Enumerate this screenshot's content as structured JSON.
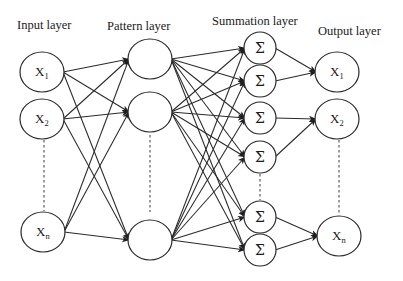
{
  "diagram": {
    "layers": [
      {
        "id": "input",
        "label": "Input layer",
        "label_pos": [
          17,
          29
        ]
      },
      {
        "id": "pattern",
        "label": "Pattern layer",
        "label_pos": [
          107,
          30
        ]
      },
      {
        "id": "summation",
        "label": "Summation layer",
        "label_pos": [
          212,
          25
        ]
      },
      {
        "id": "output",
        "label": "Output layer",
        "label_pos": [
          318,
          35
        ]
      }
    ],
    "nodes": {
      "input": [
        {
          "id": "in1",
          "symbol": "X",
          "sub": "1",
          "cx": 42,
          "cy": 72,
          "rx": 22,
          "ry": 20
        },
        {
          "id": "in2",
          "symbol": "X",
          "sub": "2",
          "cx": 42,
          "cy": 119,
          "rx": 22,
          "ry": 20
        },
        {
          "id": "inn",
          "symbol": "X",
          "sub": "n",
          "cx": 43,
          "cy": 232,
          "rx": 22,
          "ry": 20
        }
      ],
      "pattern": [
        {
          "id": "p1",
          "cx": 150,
          "cy": 59,
          "rx": 22,
          "ry": 20
        },
        {
          "id": "p2",
          "cx": 150,
          "cy": 112,
          "rx": 22,
          "ry": 20
        },
        {
          "id": "pn",
          "cx": 150,
          "cy": 240,
          "rx": 22,
          "ry": 20
        }
      ],
      "summation": [
        {
          "id": "s1",
          "symbol": "Σ",
          "cx": 260,
          "cy": 48,
          "r": 16
        },
        {
          "id": "s2",
          "symbol": "Σ",
          "cx": 260,
          "cy": 81,
          "r": 16
        },
        {
          "id": "s3",
          "symbol": "Σ",
          "cx": 260,
          "cy": 118,
          "r": 16
        },
        {
          "id": "s4",
          "symbol": "Σ",
          "cx": 260,
          "cy": 157,
          "r": 16
        },
        {
          "id": "s5",
          "symbol": "Σ",
          "cx": 260,
          "cy": 217,
          "r": 16
        },
        {
          "id": "s6",
          "symbol": "Σ",
          "cx": 260,
          "cy": 250,
          "r": 16
        }
      ],
      "output": [
        {
          "id": "o1",
          "symbol": "X",
          "sub": "1",
          "cx": 337,
          "cy": 72,
          "rx": 22,
          "ry": 20
        },
        {
          "id": "o2",
          "symbol": "X",
          "sub": "2",
          "cx": 337,
          "cy": 119,
          "rx": 22,
          "ry": 20
        },
        {
          "id": "on",
          "symbol": "X",
          "sub": "n",
          "cx": 339,
          "cy": 236,
          "rx": 22,
          "ry": 20
        }
      ]
    },
    "edges": {
      "input_to_pattern": "fully-connected",
      "pattern_to_summation": "fully-connected",
      "summation_to_output": [
        [
          "s1",
          "o1"
        ],
        [
          "s2",
          "o1"
        ],
        [
          "s3",
          "o2"
        ],
        [
          "s4",
          "o2"
        ],
        [
          "s5",
          "on"
        ],
        [
          "s6",
          "on"
        ]
      ]
    },
    "ellipsis": [
      {
        "layer": "input",
        "x": 44,
        "y1": 140,
        "y2": 211
      },
      {
        "layer": "pattern",
        "x": 150,
        "y1": 135,
        "y2": 212
      },
      {
        "layer": "summation",
        "x": 260,
        "y1": 174,
        "y2": 200
      },
      {
        "layer": "output",
        "x": 339,
        "y1": 140,
        "y2": 214
      }
    ]
  }
}
